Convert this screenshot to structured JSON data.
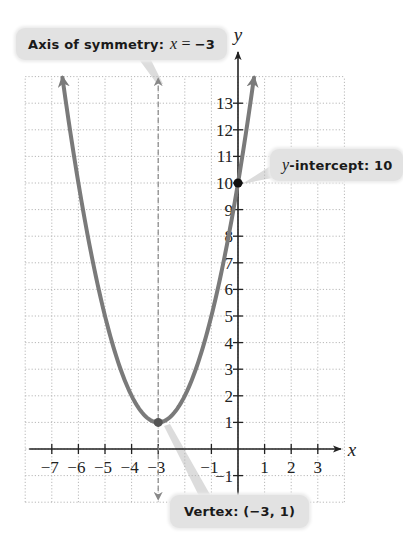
{
  "chart_data": {
    "type": "line",
    "title": "",
    "function": "y = (x + 3)^2 + 1",
    "xlabel": "x",
    "ylabel": "y",
    "xlim": [
      -8,
      4
    ],
    "ylim": [
      -2,
      14
    ],
    "grid": true,
    "grid_style": "dotted",
    "x_ticks": [
      -7,
      -6,
      -5,
      -4,
      -3,
      -1,
      1,
      2,
      3
    ],
    "x_tick_labels": [
      "−7",
      "−6",
      "−5",
      "−4",
      "−3",
      "−1",
      "1",
      "2",
      "3"
    ],
    "y_ticks": [
      -1,
      1,
      2,
      3,
      4,
      5,
      6,
      7,
      8,
      9,
      10,
      11,
      12,
      13
    ],
    "y_tick_labels": [
      "−1",
      "1",
      "2",
      "3",
      "4",
      "5",
      "6",
      "7",
      "8",
      "9",
      "10",
      "11",
      "12",
      "13"
    ],
    "series": [
      {
        "name": "parabola",
        "x": [
          -6.6,
          -6,
          -5,
          -4,
          -3,
          -2,
          -1,
          0,
          0.6
        ],
        "y": [
          13.96,
          10,
          5,
          2,
          1,
          2,
          5,
          10,
          13.96
        ],
        "color": "#7a7a7a",
        "arrows": "both-ends"
      }
    ],
    "axis_of_symmetry": {
      "x": -3,
      "style": "dashed",
      "color": "#888888"
    },
    "points": [
      {
        "name": "vertex",
        "x": -3,
        "y": 1,
        "color": "#555555"
      },
      {
        "name": "y-intercept",
        "x": 0,
        "y": 10,
        "color": "#111111"
      }
    ],
    "annotations": [
      {
        "id": "axis",
        "text": "Axis of symmetry:",
        "math_var": "x",
        "math_op": "=",
        "math_val": "−3",
        "points_to": [
          -3,
          13
        ]
      },
      {
        "id": "yint",
        "text": "-intercept: 10",
        "math_var": "y",
        "points_to": [
          0,
          10
        ]
      },
      {
        "id": "vertex",
        "text": "Vertex: (−3, 1)",
        "points_to": [
          -3,
          1
        ]
      }
    ]
  },
  "callouts": {
    "axis": {
      "label": "Axis of symmetry:",
      "var": "x",
      "op": "=",
      "val": "−3"
    },
    "yint": {
      "var": "y",
      "label": "-intercept: 10"
    },
    "vertex": {
      "label": "Vertex: (−3, 1)"
    }
  },
  "colors": {
    "grid": "#b8b8b8",
    "axis": "#222222",
    "curve": "#7a7a7a",
    "callout_bg": "#e2e2e2",
    "callout_tail": "#dcdcdc"
  }
}
